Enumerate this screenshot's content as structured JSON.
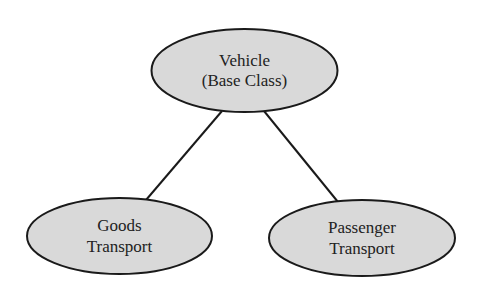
{
  "diagram": {
    "type": "hierarchy",
    "colors": {
      "background": "#ffffff",
      "node_fill": "#d9d9d9",
      "node_stroke": "#1a1a1a",
      "edge_stroke": "#1a1a1a",
      "text": "#222222"
    },
    "nodes": {
      "vehicle": {
        "line1": "Vehicle",
        "line2": "(Base Class)"
      },
      "goods": {
        "line1": "Goods",
        "line2": "Transport"
      },
      "passenger": {
        "line1": "Passenger",
        "line2": "Transport"
      }
    },
    "edges": [
      {
        "from": "Vehicle (Base Class)",
        "to": "Goods Transport"
      },
      {
        "from": "Vehicle (Base Class)",
        "to": "Passenger Transport"
      }
    ]
  }
}
